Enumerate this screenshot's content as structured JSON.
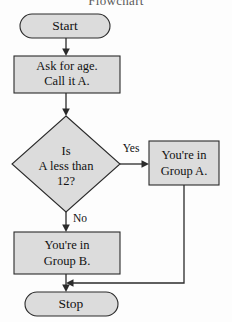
{
  "title": {
    "text": "Flowchart",
    "note": "clipped at top edge of image"
  },
  "colors": {
    "node_fill": "#dcdcdc",
    "node_stroke": "#2b2b2b",
    "text": "#111111",
    "background": "#fdfdfd"
  },
  "nodes": {
    "start": {
      "type": "terminator",
      "label": "Start"
    },
    "ask_age": {
      "type": "process",
      "line1": "Ask for age.",
      "line2": "Call it A."
    },
    "decision": {
      "type": "decision",
      "line1": "Is",
      "line2": "A less than",
      "line3": "12?"
    },
    "group_a": {
      "type": "process",
      "line1": "You're in",
      "line2": "Group A."
    },
    "group_b": {
      "type": "process",
      "line1": "You're in",
      "line2": "Group B."
    },
    "stop": {
      "type": "terminator",
      "label": "Stop"
    }
  },
  "edges": {
    "yes_label": "Yes",
    "no_label": "No"
  }
}
